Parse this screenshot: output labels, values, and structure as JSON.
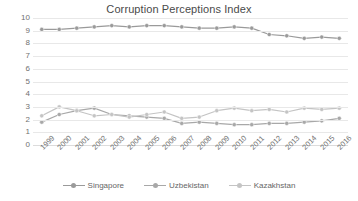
{
  "chart_data": {
    "type": "line",
    "title": "Corruption Perceptions Index",
    "xlabel": "",
    "ylabel": "",
    "ylim": [
      0,
      10
    ],
    "ytick_step": 1,
    "yticks": [
      "10",
      "9",
      "8",
      "7",
      "6",
      "5",
      "4",
      "3",
      "2",
      "1",
      "0"
    ],
    "grid": true,
    "legend_position": "bottom",
    "categories": [
      "1999",
      "2000",
      "2001",
      "2002",
      "2003",
      "2004",
      "2005",
      "2006",
      "2007",
      "2008",
      "2009",
      "2010",
      "2011",
      "2012",
      "2013",
      "2014",
      "2015",
      "2016"
    ],
    "series": [
      {
        "name": "Singapore",
        "color": "#9a9a9a",
        "marker": "circle",
        "values": [
          9.1,
          9.1,
          9.2,
          9.3,
          9.4,
          9.3,
          9.4,
          9.4,
          9.3,
          9.2,
          9.2,
          9.3,
          9.2,
          8.7,
          8.6,
          8.4,
          8.5,
          8.4
        ]
      },
      {
        "name": "Uzbekistan",
        "color": "#a8a8a8",
        "marker": "circle",
        "values": [
          1.8,
          2.4,
          2.7,
          2.9,
          2.4,
          2.3,
          2.2,
          2.1,
          1.7,
          1.8,
          1.7,
          1.6,
          1.6,
          1.7,
          1.7,
          1.8,
          1.9,
          2.1
        ]
      },
      {
        "name": "Kazakhstan",
        "color": "#c4c4c4",
        "marker": "circle",
        "values": [
          2.3,
          3.0,
          2.7,
          2.3,
          2.4,
          2.2,
          2.4,
          2.6,
          2.1,
          2.2,
          2.7,
          2.9,
          2.7,
          2.8,
          2.6,
          2.9,
          2.8,
          2.9
        ]
      }
    ]
  },
  "axes": {
    "y_tick_labels": [
      "10",
      "9",
      "8",
      "7",
      "6",
      "5",
      "4",
      "3",
      "2",
      "1",
      "0"
    ],
    "x_tick_labels": [
      "1999",
      "2000",
      "2001",
      "2002",
      "2003",
      "2004",
      "2005",
      "2006",
      "2007",
      "2008",
      "2009",
      "2010",
      "2011",
      "2012",
      "2013",
      "2014",
      "2015",
      "2016"
    ]
  },
  "legend": {
    "items": [
      {
        "label": "Singapore",
        "color": "#9a9a9a"
      },
      {
        "label": "Uzbekistan",
        "color": "#a8a8a8"
      },
      {
        "label": "Kazakhstan",
        "color": "#c4c4c4"
      }
    ]
  },
  "colors": {
    "gridline": "#e8e8e8",
    "tick_text": "#707070",
    "title_text": "#4a4a4a",
    "background": "#ffffff"
  }
}
